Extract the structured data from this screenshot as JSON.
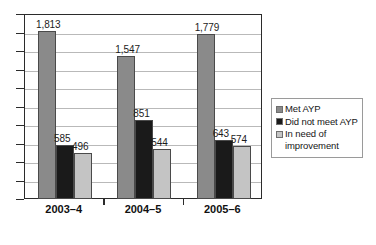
{
  "chart_data": {
    "type": "bar",
    "title": "",
    "subtitle": "",
    "xlabel": "",
    "ylabel": "",
    "categories": [
      "2003–4",
      "2004–5",
      "2005–6"
    ],
    "series": [
      {
        "name": "Met AYP",
        "color": "#8a8a8a",
        "values": [
          1813,
          1547,
          1779
        ],
        "labels": [
          "1,813",
          "1,547",
          "1,779"
        ]
      },
      {
        "name": "Did not meet AYP",
        "color": "#1a1a1a",
        "values": [
          585,
          851,
          643
        ],
        "labels": [
          "585",
          "851",
          "643"
        ]
      },
      {
        "name": "In need of improvement",
        "color": "#c4c4c4",
        "values": [
          496,
          544,
          574
        ],
        "labels": [
          "496",
          "544",
          "574"
        ]
      }
    ],
    "ylim": [
      0,
      2000
    ],
    "ytick_interval": 200,
    "ytick_labels_shown": false,
    "grid": true,
    "grid_axis": "y",
    "legend_position": "right-outside",
    "legend_entries": [
      "Met AYP",
      "Did not meet AYP",
      "In need of improvement"
    ]
  },
  "legend": {
    "entries": [
      {
        "label": "Met AYP",
        "color": "#8a8a8a"
      },
      {
        "label": "Did not meet AYP",
        "color": "#1a1a1a"
      },
      {
        "label": "In need of improvement",
        "color": "#c4c4c4"
      }
    ]
  },
  "axis": {
    "x_categories": [
      "2003–4",
      "2004–5",
      "2005–6"
    ]
  },
  "colors": {
    "met": "#8a8a8a",
    "not_met": "#1a1a1a",
    "needs_improvement": "#c4c4c4",
    "axis": "#2b2b2b",
    "grid": "#b9b9b9",
    "background": "#ffffff"
  }
}
